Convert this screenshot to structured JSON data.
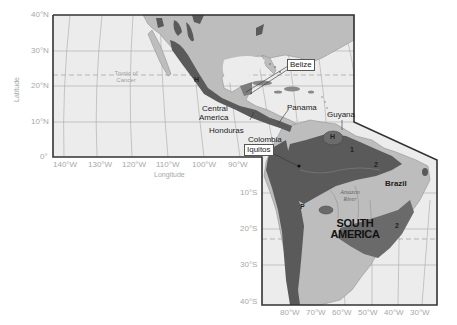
{
  "map": {
    "title": "Central and South America biogeographic regions",
    "colors": {
      "ocean": "#ececec",
      "land": "#bdbdbd",
      "region_dark": "#5a5a5a",
      "region_mid": "#7c7c7c",
      "frame": "#333333",
      "grid": "#a0a0a0",
      "tick_text": "#a8a8a8"
    },
    "axes": {
      "latitude_title": "Latitude",
      "longitude_title": "Longitude",
      "lat_ticks_north": [
        "40°N",
        "30°N",
        "20°N",
        "10°N",
        "0°"
      ],
      "lat_ticks_south": [
        "10°S",
        "20°S",
        "30°S",
        "40°S"
      ],
      "lon_ticks_top": [
        "140°W",
        "130°W",
        "120°W",
        "110°W",
        "100°W",
        "90°W"
      ],
      "lon_ticks_bottom": [
        "80°W",
        "70°W",
        "60°W",
        "50°W",
        "40°W",
        "30°W"
      ]
    },
    "annotations": {
      "tropic": "Tropic of Cancer",
      "tropic_line1": "Tropic of",
      "tropic_line2": "Cancer",
      "central_america_1": "Central",
      "central_america_2": "America",
      "honduras": "Honduras",
      "belize": "Belize",
      "panama": "Panama",
      "guyana": "Guyana",
      "colombia": "Colombia",
      "iquitos": "Iquitos",
      "brazil": "Brazil",
      "amazon_1": "Amazon",
      "amazon_2": "River",
      "south_america_1": "SOUTH",
      "south_america_2": "AMERICA"
    },
    "region_letters": {
      "mexico": "H",
      "guiana_highlands": "H",
      "amazon": "1",
      "east_amazon": "2",
      "atlantic": "2",
      "andes": "P"
    }
  }
}
